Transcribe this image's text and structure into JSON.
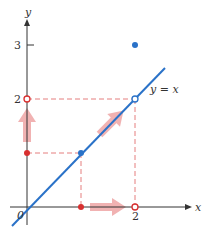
{
  "diagram": {
    "axes": {
      "x_label": "x",
      "y_label": "y",
      "origin_label": "0",
      "x_ticks": [
        {
          "value": 2,
          "label": "2"
        }
      ],
      "y_ticks": [
        {
          "value": 2,
          "label": "2"
        },
        {
          "value": 3,
          "label": "3"
        }
      ]
    },
    "line_label": "y = x",
    "colors": {
      "axis": "#333333",
      "line": "#2a72c8",
      "guide": "#e06060",
      "arrow": "#e88080",
      "point_blue": "#2a72c8",
      "point_red": "#d83030"
    },
    "points": [
      {
        "name": "filled-point-2-3",
        "x": 2,
        "y": 3,
        "style": "filled",
        "color": "blue"
      },
      {
        "name": "filled-point-1-1",
        "x": 1,
        "y": 1,
        "style": "filled",
        "color": "blue"
      },
      {
        "name": "open-point-2-2",
        "x": 2,
        "y": 2,
        "style": "open",
        "color": "blue"
      },
      {
        "name": "open-point-y2",
        "x": 0,
        "y": 2,
        "style": "open",
        "color": "red"
      },
      {
        "name": "open-point-x2",
        "x": 2,
        "y": 0,
        "style": "open",
        "color": "red"
      },
      {
        "name": "filled-point-y1",
        "x": 0,
        "y": 1,
        "style": "filled",
        "color": "red"
      },
      {
        "name": "filled-point-x1",
        "x": 1,
        "y": 0,
        "style": "filled",
        "color": "red"
      }
    ]
  }
}
